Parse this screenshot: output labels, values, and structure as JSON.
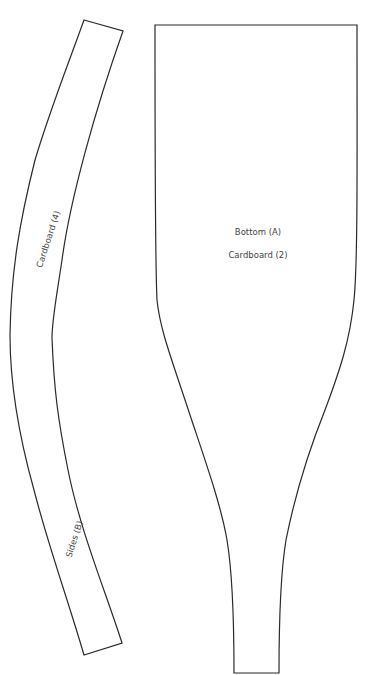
{
  "pieces": [
    {
      "id": "sides",
      "labels": [
        "Cardboard (4)",
        "Sides (B)"
      ]
    },
    {
      "id": "bottom",
      "labels": [
        "Bottom (A)",
        "Cardboard (2)"
      ]
    }
  ],
  "colors": {
    "stroke": "#2a2a2a",
    "text": "#444444",
    "background": "#ffffff"
  }
}
